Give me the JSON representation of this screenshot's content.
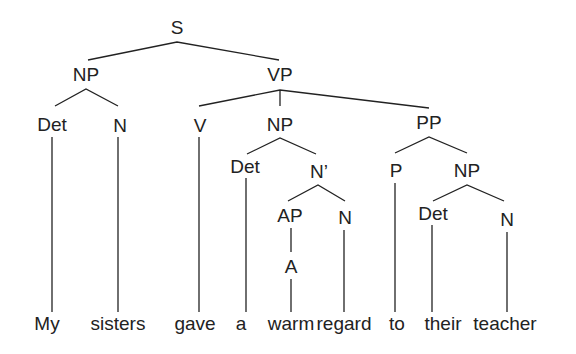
{
  "tree": {
    "type": "syntax-tree",
    "sentence": "My sisters gave a warm regard to their teacher",
    "nodes": {
      "S": "S",
      "NP_subj": "NP",
      "Det_subj": "Det",
      "N_subj": "N",
      "VP": "VP",
      "V": "V",
      "NP_obj": "NP",
      "Det_obj": "Det",
      "Nbar": "N’",
      "AP": "AP",
      "A": "A",
      "N_obj": "N",
      "PP": "PP",
      "P": "P",
      "NP_pp": "NP",
      "Det_pp": "Det",
      "N_pp": "N"
    },
    "words": [
      "My",
      "sisters",
      "gave",
      "a",
      "warm",
      "regard",
      "to",
      "their",
      "teacher"
    ],
    "bracketing": "[S [NP [Det My] [N sisters]] [VP [V gave] [NP [Det a] [N' [AP [A warm]] [N regard]]] [PP [P to] [NP [Det their] [N teacher]]]]]"
  }
}
